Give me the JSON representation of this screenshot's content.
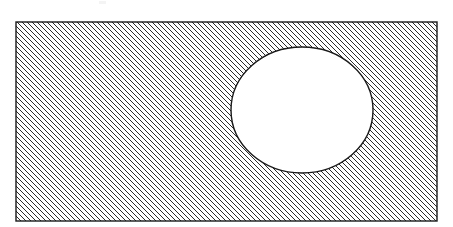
{
  "figure": {
    "kind": "geometric-cross-section",
    "canvas": {
      "width": 453,
      "height": 227,
      "background": "#ffffff"
    },
    "colors": {
      "outline": "#1a1a1a",
      "hatch": "#2b2b2b",
      "fill": "#ffffff",
      "hole_fill": "#ffffff",
      "artifact": "#f2f2f2"
    },
    "rectangle": {
      "name": "hatched-plate",
      "x": 16,
      "y": 22,
      "width": 421,
      "height": 199,
      "stroke_width": 1.4,
      "fill_label": "section-hatch"
    },
    "hatch": {
      "name": "section-hatch-pattern",
      "angle_degrees": 45,
      "direction": "descending",
      "slope_label": "backslash",
      "spacing_px": 5,
      "line_width_px": 1.1,
      "tile_px": 5
    },
    "hole": {
      "name": "circular-hole",
      "shape": "ellipse",
      "center_x": 302,
      "center_y": 110,
      "radius_x": 71,
      "radius_y": 63,
      "stroke_width": 1.4,
      "fill": "#ffffff"
    },
    "artifact": {
      "name": "faint-top-smudge",
      "x": 99,
      "y": 1,
      "width": 7,
      "height": 3
    }
  },
  "chart_data": {
    "type": "diagram",
    "xlabel": "",
    "ylabel": "",
    "grid": false,
    "legend": "none",
    "shapes": [
      {
        "id": "plate",
        "type": "rectangle",
        "fill": "diagonal-hatch-45-descending",
        "x": 16,
        "y": 22,
        "width": 421,
        "height": 199
      },
      {
        "id": "hole",
        "type": "circle",
        "fill": "none",
        "cx": 302,
        "cy": 110,
        "rx": 71,
        "ry": 63
      }
    ],
    "annotations": []
  }
}
